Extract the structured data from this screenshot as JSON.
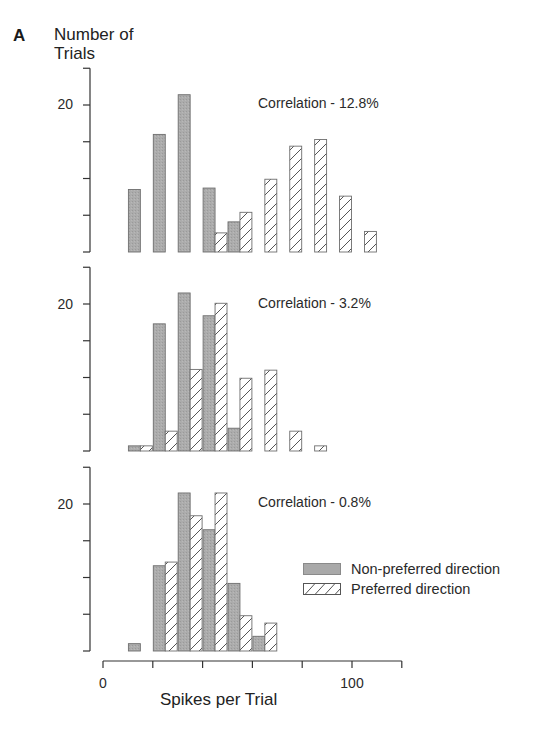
{
  "figure": {
    "panel_letter": "A",
    "ylabel_line1": "Number of",
    "ylabel_line2": "Trials",
    "xlabel": "Spikes per Trial",
    "xtick_labels": [
      {
        "value": 0,
        "label": "0"
      },
      {
        "value": 100,
        "label": "100"
      }
    ],
    "ytick_label": "20",
    "legend": {
      "non_preferred": "Non-preferred direction",
      "preferred": "Preferred direction"
    },
    "colors": {
      "non_preferred_fill": "#a9a9a9",
      "non_preferred_edge": "#6e6e6e",
      "preferred_fill": "#ffffff",
      "preferred_edge": "#6e6e6e",
      "axis": "#333333"
    }
  },
  "chart_data": [
    {
      "type": "bar",
      "title": "Correlation - 12.8%",
      "annotation": "Correlation - 12.8%",
      "xlabel": "Spikes per Trial",
      "ylabel": "Number of Trials",
      "xlim": [
        0,
        120
      ],
      "ylim": [
        0,
        25
      ],
      "xticks": [
        0,
        20,
        40,
        60,
        80,
        100,
        120
      ],
      "yticks": [
        0,
        5,
        10,
        15,
        20,
        25
      ],
      "bin_width": 10,
      "categories": [
        10,
        20,
        30,
        40,
        50,
        60,
        70,
        80,
        90,
        100
      ],
      "series": [
        {
          "name": "Non-preferred direction",
          "values": [
            8.5,
            16,
            21.4,
            8.7,
            4.1,
            0,
            0,
            0,
            0,
            0
          ]
        },
        {
          "name": "Preferred direction",
          "values": [
            0,
            0,
            0,
            2.6,
            5.4,
            9.9,
            14.4,
            15.3,
            7.6,
            2.8
          ]
        }
      ],
      "legend_position": "none",
      "grid": false
    },
    {
      "type": "bar",
      "title": "Correlation - 3.2%",
      "annotation": "Correlation - 3.2%",
      "xlabel": "Spikes per Trial",
      "ylabel": "Number of Trials",
      "xlim": [
        0,
        120
      ],
      "ylim": [
        0,
        25
      ],
      "xticks": [
        0,
        20,
        40,
        60,
        80,
        100,
        120
      ],
      "yticks": [
        0,
        5,
        10,
        15,
        20,
        25
      ],
      "bin_width": 10,
      "categories": [
        10,
        20,
        30,
        40,
        50,
        60,
        70,
        80
      ],
      "series": [
        {
          "name": "Non-preferred direction",
          "values": [
            0.7,
            17.3,
            21.5,
            18.4,
            3.1,
            0,
            0,
            0
          ]
        },
        {
          "name": "Preferred direction",
          "values": [
            0.7,
            2.7,
            11.1,
            20.1,
            9.9,
            11,
            2.7,
            0.7
          ]
        }
      ],
      "legend_position": "none",
      "grid": false
    },
    {
      "type": "bar",
      "title": "Correlation - 0.8%",
      "annotation": "Correlation - 0.8%",
      "xlabel": "Spikes per Trial",
      "ylabel": "Number of Trials",
      "xlim": [
        0,
        120
      ],
      "ylim": [
        0,
        25
      ],
      "xticks": [
        0,
        20,
        40,
        60,
        80,
        100,
        120
      ],
      "xtick_labels": [
        "0",
        "",
        "",
        "",
        "",
        "100",
        ""
      ],
      "yticks": [
        0,
        5,
        10,
        15,
        20,
        25
      ],
      "bin_width": 10,
      "categories": [
        10,
        20,
        30,
        40,
        50,
        60
      ],
      "series": [
        {
          "name": "Non-preferred direction",
          "values": [
            1,
            11.6,
            21.5,
            16.5,
            9.2,
            2
          ]
        },
        {
          "name": "Preferred direction",
          "values": [
            0,
            12.1,
            18.4,
            21.5,
            4.8,
            3.8
          ]
        }
      ],
      "legend_position": "right",
      "grid": false
    }
  ]
}
